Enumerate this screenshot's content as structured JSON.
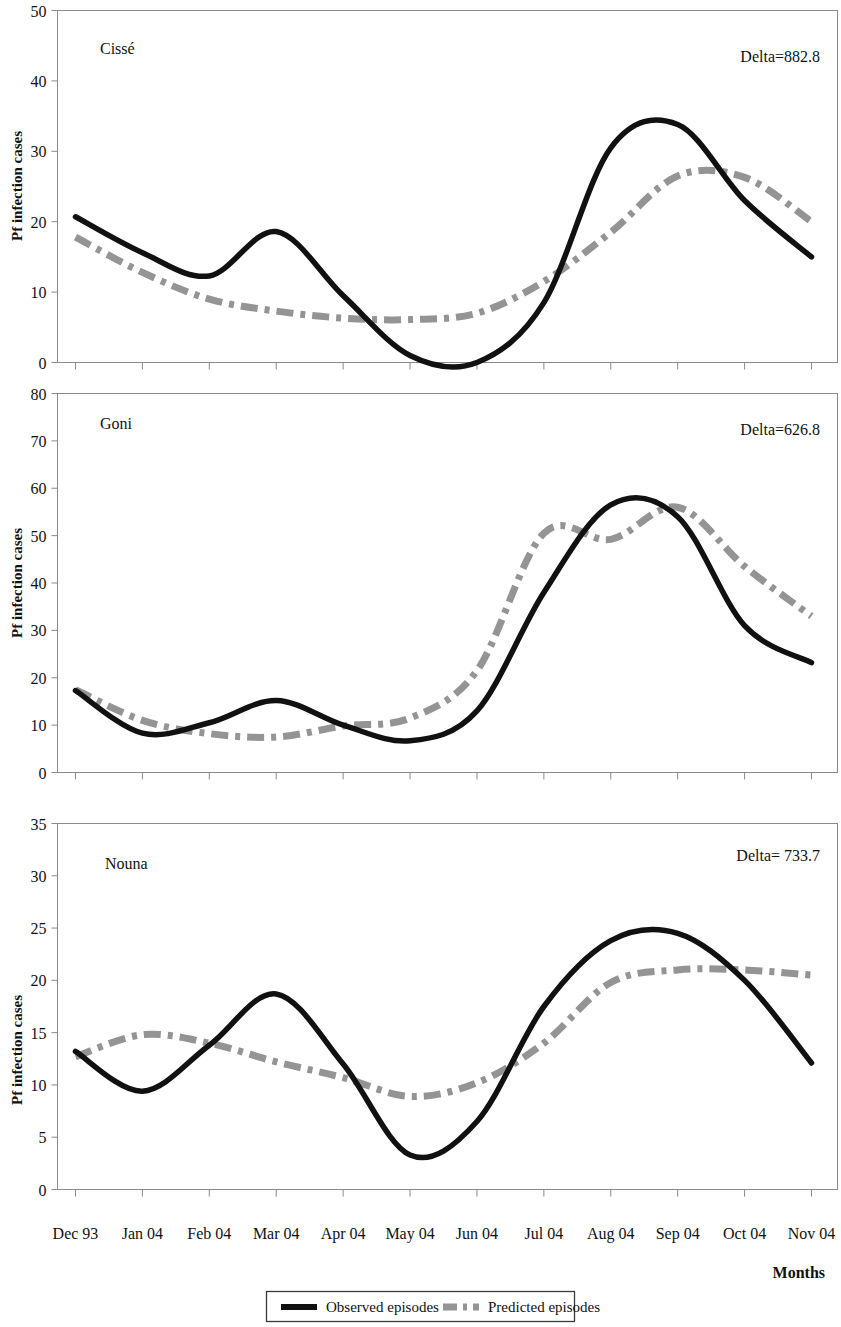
{
  "figure": {
    "y_axis_title": "Pf infection cases",
    "x_axis_title": "Months"
  },
  "legend": {
    "observed_label": "Observed episodes",
    "predicted_label": "Predicted episodes",
    "observed_color": "#111111",
    "predicted_color": "#949494"
  },
  "x_categories": [
    "Dec 93",
    "Jan 04",
    "Feb 04",
    "Mar 04",
    "Apr 04",
    "May 04",
    "Jun 04",
    "Jul 04",
    "Aug 04",
    "Sep 04",
    "Oct 04",
    "Nov 04"
  ],
  "chart_data": [
    {
      "type": "line",
      "title": "Cissé",
      "annotation": "Delta=882.8",
      "xlabel": "Months",
      "ylabel": "Pf infection cases",
      "ylim": [
        0,
        50
      ],
      "yticks": [
        0,
        10,
        20,
        30,
        40,
        50
      ],
      "grid": false,
      "legend_position": "bottom",
      "x": [
        "Dec 93",
        "Jan 04",
        "Feb 04",
        "Mar 04",
        "Apr 04",
        "May 04",
        "Jun 04",
        "Jul 04",
        "Aug 04",
        "Sep 04",
        "Oct 04",
        "Nov 04"
      ],
      "series": [
        {
          "name": "Observed episodes",
          "color": "#111111",
          "style": "solid",
          "values": [
            20.7,
            15.6,
            12.3,
            18.6,
            9.5,
            1.0,
            0.0,
            8.5,
            30.5,
            33.8,
            23.0,
            15.0
          ]
        },
        {
          "name": "Predicted episodes",
          "color": "#949494",
          "style": "dash-dot",
          "values": [
            17.8,
            12.8,
            9.0,
            7.3,
            6.3,
            6.1,
            7.0,
            11.5,
            18.5,
            26.5,
            26.3,
            20.0
          ]
        }
      ]
    },
    {
      "type": "line",
      "title": "Goni",
      "annotation": "Delta=626.8",
      "xlabel": "Months",
      "ylabel": "Pf infection cases",
      "ylim": [
        0,
        80
      ],
      "yticks": [
        0,
        10,
        20,
        30,
        40,
        50,
        60,
        70,
        80
      ],
      "grid": false,
      "legend_position": "bottom",
      "x": [
        "Dec 93",
        "Jan 04",
        "Feb 04",
        "Mar 04",
        "Apr 04",
        "May 04",
        "Jun 04",
        "Jul 04",
        "Aug 04",
        "Sep 04",
        "Oct 04",
        "Nov 04"
      ],
      "series": [
        {
          "name": "Observed episodes",
          "color": "#111111",
          "style": "solid",
          "values": [
            17.3,
            8.3,
            10.5,
            15.2,
            10.0,
            6.7,
            13.0,
            38.0,
            56.5,
            54.0,
            31.0,
            23.2
          ]
        },
        {
          "name": "Predicted episodes",
          "color": "#949494",
          "style": "dash-dot",
          "values": [
            17.5,
            11.0,
            8.2,
            7.5,
            9.8,
            11.5,
            21.5,
            50.5,
            49.2,
            56.0,
            43.5,
            33.0
          ]
        }
      ]
    },
    {
      "type": "line",
      "title": "Nouna",
      "annotation": "Delta= 733.7",
      "xlabel": "Months",
      "ylabel": "Pf infection cases",
      "ylim": [
        0,
        35
      ],
      "yticks": [
        0,
        5,
        10,
        15,
        20,
        25,
        30,
        35
      ],
      "grid": false,
      "legend_position": "bottom",
      "x": [
        "Dec 93",
        "Jan 04",
        "Feb 04",
        "Mar 04",
        "Apr 04",
        "May 04",
        "Jun 04",
        "Jul 04",
        "Aug 04",
        "Sep 04",
        "Oct 04",
        "Nov 04"
      ],
      "series": [
        {
          "name": "Observed episodes",
          "color": "#111111",
          "style": "solid",
          "values": [
            13.2,
            9.4,
            13.8,
            18.7,
            12.0,
            3.3,
            6.5,
            17.5,
            23.8,
            24.5,
            20.0,
            12.1
          ]
        },
        {
          "name": "Predicted episodes",
          "color": "#949494",
          "style": "dash-dot",
          "values": [
            12.7,
            14.8,
            14.0,
            12.2,
            10.7,
            8.9,
            10.2,
            14.0,
            19.8,
            21.0,
            21.0,
            20.5
          ]
        }
      ]
    }
  ]
}
